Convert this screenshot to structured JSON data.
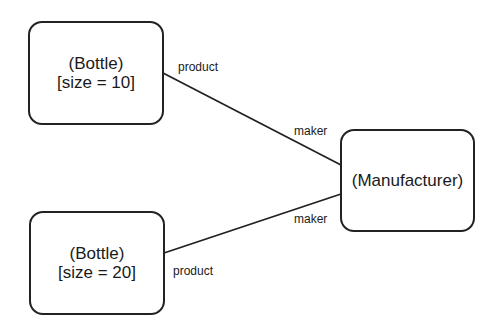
{
  "diagram": {
    "type": "object-diagram",
    "nodes": [
      {
        "id": "bottle1",
        "class_label": "(Bottle)",
        "attribute_label": "[size = 10]",
        "box": {
          "x": 28,
          "y": 21,
          "w": 136,
          "h": 104
        }
      },
      {
        "id": "bottle2",
        "class_label": "(Bottle)",
        "attribute_label": "[size = 20]",
        "box": {
          "x": 29,
          "y": 211,
          "w": 136,
          "h": 104
        }
      },
      {
        "id": "manufacturer",
        "class_label": "(Manufacturer)",
        "box": {
          "x": 340,
          "y": 129,
          "w": 135,
          "h": 103
        }
      }
    ],
    "edges": [
      {
        "from": "bottle1",
        "to": "manufacturer",
        "from_role": "product",
        "to_role": "maker",
        "points": {
          "x1": 163,
          "y1": 73,
          "x2": 341,
          "y2": 165
        }
      },
      {
        "from": "bottle2",
        "to": "manufacturer",
        "from_role": "product",
        "to_role": "maker",
        "points": {
          "x1": 164,
          "y1": 253,
          "x2": 341,
          "y2": 194
        }
      }
    ],
    "colors": {
      "stroke": "#222222",
      "text": "#1a1a1a",
      "background": "#ffffff"
    }
  }
}
